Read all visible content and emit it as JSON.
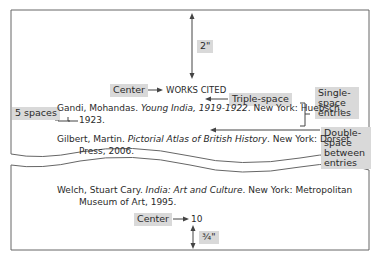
{
  "diagram": {
    "page_top": {
      "top_margin_label": "2\"",
      "heading_callout": "Center",
      "heading": "WORKS CITED",
      "triple_space_callout": "Triple-space",
      "single_space_callout": [
        "Single-",
        "space",
        "entries"
      ],
      "indent_callout": "5 spaces",
      "double_space_callout": [
        "Double-",
        "space",
        "between",
        "entries"
      ],
      "entries": [
        {
          "line1_pre": "Gandi, Mohandas. ",
          "line1_italic": "Young India, 1919-1922",
          "line1_post": ". New York: Huebsch,",
          "line2": "1923."
        },
        {
          "line1_pre": "Gilbert, Martin. ",
          "line1_italic": "Pictorial Atlas of British History",
          "line1_post": ". New York: Dorset",
          "line2": "Press, 2006."
        }
      ]
    },
    "page_bottom": {
      "entries": [
        {
          "line1_pre": "Welch, Stuart Cary. ",
          "line1_italic": "India: Art and Culture",
          "line1_post": ". New York: Metropolitan",
          "line2": "Museum of Art, 1995."
        }
      ],
      "page_number_callout": "Center",
      "page_number": "10",
      "bottom_margin_label": "¾\""
    },
    "colors": {
      "label_bg": "#d9d9d9",
      "line": "#555555",
      "text": "#2a2a2a"
    }
  }
}
